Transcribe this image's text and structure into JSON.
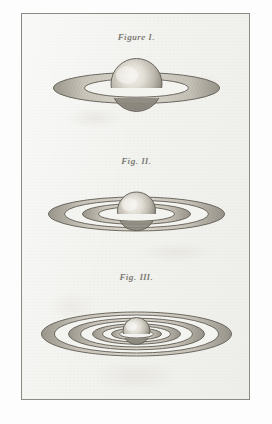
{
  "plate": {
    "medium": "engraving",
    "paper_color": "#f3f3f0",
    "margin_color": "#fdfdfd",
    "ink_color": "#6d6a64",
    "border_color": "#8a8a86"
  },
  "figures": [
    {
      "label": "Figure I.",
      "subject": "saturn-with-single-ring",
      "ring_count": 1,
      "ring_labels": [
        "outer ring"
      ]
    },
    {
      "label": "Fig. II.",
      "subject": "saturn-with-two-rings",
      "ring_count": 2,
      "ring_labels": [
        "outer ring",
        "inner ring"
      ]
    },
    {
      "label": "Fig. III.",
      "subject": "saturn-with-four-rings",
      "ring_count": 4,
      "ring_labels": [
        "outer ring",
        "second ring",
        "third ring",
        "inner ring"
      ]
    }
  ]
}
